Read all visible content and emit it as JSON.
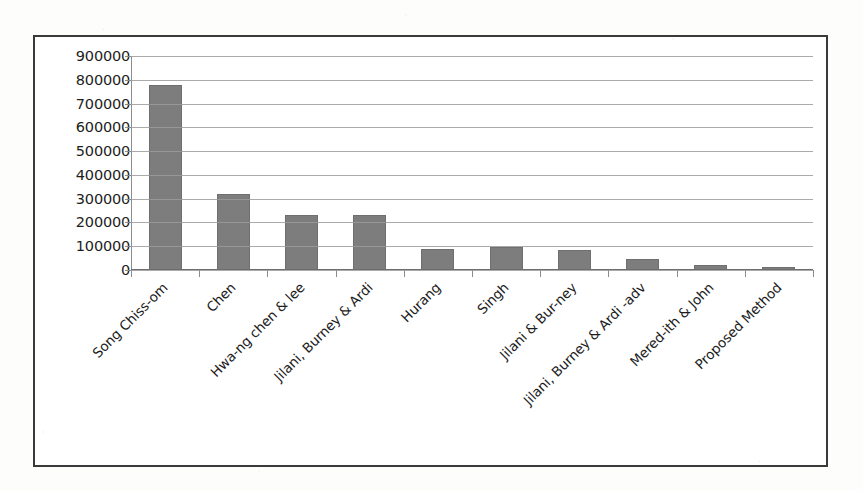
{
  "chart_data": {
    "type": "bar",
    "title": "",
    "subtitle": "",
    "xlabel": "",
    "ylabel": "",
    "ylim": [
      0,
      900000
    ],
    "grid": true,
    "legend": false,
    "legend_position": "none",
    "bar_color": "#7d7d7d",
    "categories": [
      "Song Chiss-om",
      "Chen",
      "Hwa-ng chen & lee",
      "Jilani, Burney & Ardi",
      "Hurang",
      "Singh",
      "Jilani & Bur-ney",
      "Jilani, Burney & Ardi -adv",
      "Mered-ith & John",
      "Proposed Method"
    ],
    "values": [
      780000,
      320000,
      230000,
      230000,
      90000,
      95000,
      85000,
      45000,
      22000,
      12000
    ],
    "ytick_labels": [
      "900000",
      "800000",
      "700000",
      "600000",
      "500000",
      "400000",
      "300000",
      "200000",
      "100000",
      "0"
    ],
    "ytick_values": [
      900000,
      800000,
      700000,
      600000,
      500000,
      400000,
      300000,
      200000,
      100000,
      0
    ]
  }
}
